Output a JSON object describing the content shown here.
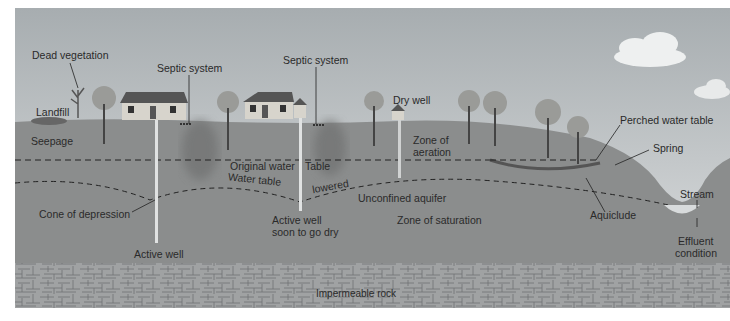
{
  "diagram": {
    "type": "groundwater cross-section",
    "colors": {
      "sky_top": "#a9afb2",
      "sky_bottom": "#d9dcdd",
      "ground": "#8a8c8c",
      "saturated": "#828484",
      "rock": "#9c9e9f",
      "label": "#2a2a2a"
    },
    "labels": {
      "dead_vegetation": "Dead vegetation",
      "landfill": "Landfill",
      "seepage": "Seepage",
      "septic_system_1": "Septic system",
      "septic_system_2": "Septic system",
      "dry_well": "Dry well",
      "zone_of_aeration_1": "Zone of",
      "zone_of_aeration_2": "aeration",
      "perched_water_table": "Perched water table",
      "spring": "Spring",
      "original_water_table_1": "Original water",
      "original_water_table_2": "Table",
      "water_table": "Water table",
      "lowered": "lowered",
      "cone_of_depression": "Cone of depression",
      "active_well": "Active well",
      "active_well_dry_1": "Active well",
      "active_well_dry_2": "soon to go dry",
      "unconfined_aquifer": "Unconfined aquifer",
      "zone_of_saturation": "Zone of saturation",
      "aquiclude": "Aquiclude",
      "stream": "Stream",
      "effluent_1": "Effluent",
      "effluent_2": "condition",
      "impermeable_rock": "Impermeable rock"
    }
  }
}
